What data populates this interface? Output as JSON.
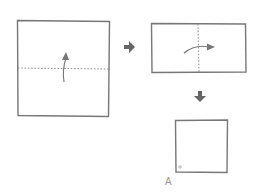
{
  "diagram": {
    "title": "",
    "steps": [
      {
        "id": "step-1",
        "shape": "square",
        "fold_line": "horizontal",
        "fold_direction": "up"
      },
      {
        "id": "step-2",
        "shape": "rectangle",
        "fold_line": "vertical",
        "fold_direction": "right"
      },
      {
        "id": "step-3",
        "shape": "small-square",
        "marker": "corner-dot"
      }
    ],
    "arrows": [
      {
        "from": "step-1",
        "to": "step-2",
        "direction": "right"
      },
      {
        "from": "step-2",
        "to": "step-3",
        "direction": "down"
      }
    ],
    "result_label": "A",
    "colors": {
      "line": "#7a7a7a",
      "arrow": "#666666",
      "label": "#9a9a9a"
    }
  }
}
